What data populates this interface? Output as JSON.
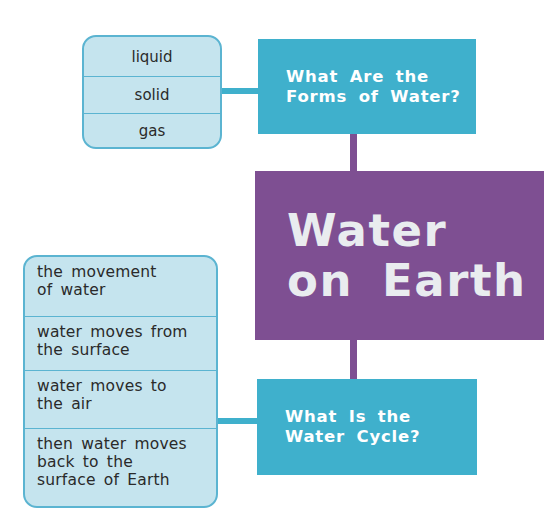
{
  "diagram": {
    "center": {
      "line1": "Water",
      "line2": "on Earth",
      "color": "#7e4f92"
    },
    "top_question": {
      "line1": "What Are the",
      "line2": "Forms of Water?",
      "color": "#3fb0cc"
    },
    "bottom_question": {
      "line1": "What Is the",
      "line2": "Water Cycle?",
      "color": "#3fb0cc"
    },
    "forms_list": [
      "liquid",
      "solid",
      "gas"
    ],
    "cycle_list": [
      {
        "line1": "the movement",
        "line2": "of water"
      },
      {
        "line1": "water moves from",
        "line2": "the surface"
      },
      {
        "line1": "water moves to",
        "line2": "the air"
      },
      {
        "line1": "then water moves",
        "line2": "back to the",
        "line3": "surface of Earth"
      }
    ],
    "list_fill": "#c5e4ee",
    "list_border": "#5bb4d1"
  }
}
